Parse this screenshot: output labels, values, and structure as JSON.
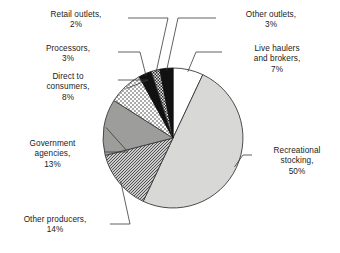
{
  "chart_data": {
    "type": "pie",
    "title": "",
    "subtitle": "",
    "xlabel": "",
    "ylabel": "",
    "legend_position": "none",
    "grid": false,
    "units": "percent",
    "start_angle_deg": 0,
    "direction": "clockwise",
    "categories": [
      "Live haulers and brokers",
      "Recreational stocking",
      "Other producers",
      "Government agencies",
      "Direct to consumers",
      "Processors",
      "Retail outlets",
      "Other outlets"
    ],
    "values": [
      7,
      50,
      14,
      13,
      8,
      3,
      2,
      3
    ],
    "slices": [
      {
        "key": "live-haulers",
        "label": "Live haulers\nand brokers,\n7%",
        "name": "Live haulers and brokers",
        "value": 7,
        "value_text": "7%",
        "fill": "#ffffff",
        "pattern": "solid",
        "stroke": "#3a3a3a"
      },
      {
        "key": "recreational-stocking",
        "label": "Recreational\nstocking,\n50%",
        "name": "Recreational stocking",
        "value": 50,
        "value_text": "50%",
        "fill": "#d8d8d6",
        "pattern": "solid",
        "stroke": "#3a3a3a"
      },
      {
        "key": "other-producers",
        "label": "Other producers,\n14%",
        "name": "Other producers",
        "value": 14,
        "value_text": "14%",
        "fill": "#ffffff",
        "pattern": "diagonal-hatch",
        "stroke": "#3a3a3a"
      },
      {
        "key": "government-agencies",
        "label": "Government\nagencies,\n13%",
        "name": "Government agencies",
        "value": 13,
        "value_text": "13%",
        "fill": "#9d9d9b",
        "pattern": "solid",
        "stroke": "#3a3a3a"
      },
      {
        "key": "direct-to-consumers",
        "label": "Direct to\nconsumers,\n8%",
        "name": "Direct to consumers",
        "value": 8,
        "value_text": "8%",
        "fill": "#ffffff",
        "pattern": "stipple",
        "stroke": "#3a3a3a"
      },
      {
        "key": "processors",
        "label": "Processors,\n3%",
        "name": "Processors",
        "value": 3,
        "value_text": "3%",
        "fill": "#111111",
        "pattern": "solid",
        "stroke": "#111111"
      },
      {
        "key": "retail-outlets",
        "label": "Retail outlets,\n2%",
        "name": "Retail outlets",
        "value": 2,
        "value_text": "2%",
        "fill": "#ffffff",
        "pattern": "checker",
        "stroke": "#3a3a3a"
      },
      {
        "key": "other-outlets",
        "label": "Other outlets,\n3%",
        "name": "Other outlets",
        "value": 3,
        "value_text": "3%",
        "fill": "#111111",
        "pattern": "solid",
        "stroke": "#111111"
      }
    ],
    "colors": {
      "outline": "#3a3a3a",
      "leader_line": "#3a3a3a",
      "text": "#1a1a1a",
      "background": "#ffffff"
    }
  }
}
